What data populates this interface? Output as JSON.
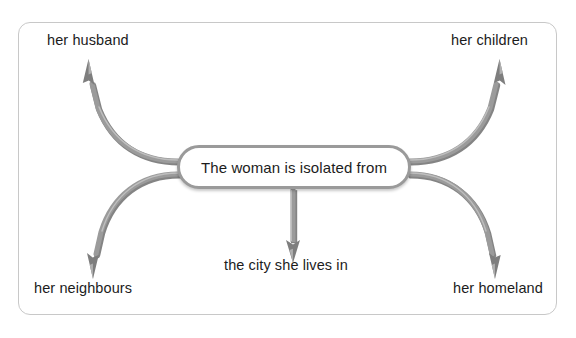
{
  "diagram": {
    "title_text": "The woman is isolated from",
    "center": {
      "label": "The woman is isolated from",
      "shape": "rounded-rectangle",
      "fill_color": "#ffffff",
      "border_color": "#9a9a9a"
    },
    "frame": {
      "border_color": "#c8c8c8",
      "shape": "rounded-rectangle"
    },
    "arrow_color": "#8c8c8c",
    "arrow_shadow_color": "#5e5e5e",
    "branches": [
      {
        "id": "husband",
        "label": "her husband",
        "direction": "upper-left",
        "arrow_style": "curved"
      },
      {
        "id": "children",
        "label": "her children",
        "direction": "upper-right",
        "arrow_style": "curved"
      },
      {
        "id": "neighbours",
        "label": "her neighbours",
        "direction": "lower-left",
        "arrow_style": "curved"
      },
      {
        "id": "city",
        "label": "the city she lives in",
        "direction": "down",
        "arrow_style": "straight"
      },
      {
        "id": "homeland",
        "label": "her homeland",
        "direction": "lower-right",
        "arrow_style": "curved"
      }
    ]
  }
}
